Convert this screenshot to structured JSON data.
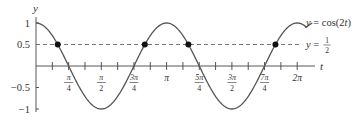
{
  "chart_data": {
    "type": "line",
    "title": "",
    "xlabel": "t",
    "ylabel": "y",
    "xlim": [
      0,
      6.5
    ],
    "ylim": [
      -1,
      1
    ],
    "grid": false,
    "x_ticks": [
      {
        "value": 0.3927,
        "label": ""
      },
      {
        "value": 0.7854,
        "label": "π/4",
        "num": "π",
        "den": "4"
      },
      {
        "value": 1.1781,
        "label": ""
      },
      {
        "value": 1.5708,
        "label": "π/2",
        "num": "π",
        "den": "2"
      },
      {
        "value": 1.9635,
        "label": ""
      },
      {
        "value": 2.3562,
        "label": "3π/4",
        "num": "3π",
        "den": "4"
      },
      {
        "value": 2.7489,
        "label": ""
      },
      {
        "value": 3.1416,
        "label": "π",
        "num": "π",
        "den": ""
      },
      {
        "value": 3.5343,
        "label": ""
      },
      {
        "value": 3.927,
        "label": "5π/4",
        "num": "5π",
        "den": "4"
      },
      {
        "value": 4.3197,
        "label": ""
      },
      {
        "value": 4.7124,
        "label": "3π/2",
        "num": "3π",
        "den": "2"
      },
      {
        "value": 5.1051,
        "label": ""
      },
      {
        "value": 5.4978,
        "label": "7π/4",
        "num": "7π",
        "den": "4"
      },
      {
        "value": 5.8905,
        "label": ""
      },
      {
        "value": 6.2832,
        "label": "2π",
        "num": "2π",
        "den": ""
      }
    ],
    "y_ticks": [
      {
        "value": 1,
        "label": "1"
      },
      {
        "value": 0.5,
        "label": "0.5"
      },
      {
        "value": -0.5,
        "label": "−0.5"
      },
      {
        "value": -1,
        "label": "−1"
      }
    ],
    "series": [
      {
        "name": "y = cos(2t)",
        "style": "solid",
        "function": "cos(2t)",
        "x_range": [
          0,
          6.5
        ],
        "legend_label": "y = cos(2t)"
      },
      {
        "name": "y = 1/2",
        "style": "dashed",
        "function": "0.5",
        "x_range": [
          0,
          6.5
        ],
        "legend_label": "y = 1/2"
      }
    ],
    "intersection_points": [
      {
        "t": 0.5236,
        "t_label": "π/6",
        "y": 0.5
      },
      {
        "t": 2.618,
        "t_label": "5π/6",
        "y": 0.5
      },
      {
        "t": 3.6652,
        "t_label": "7π/6",
        "y": 0.5
      },
      {
        "t": 5.7596,
        "t_label": "11π/6",
        "y": 0.5
      }
    ],
    "annotations": [
      {
        "text": "y = cos(2t)",
        "near": "curve end, top right"
      },
      {
        "text": "y = 1/2",
        "near": "dashed line end, right"
      }
    ]
  },
  "labels": {
    "y_axis": "y",
    "x_axis": "t",
    "curve_legend": "y = cos(2t)",
    "line_legend_prefix": "y =",
    "line_legend_num": "1",
    "line_legend_den": "2"
  },
  "colors": {
    "curve": "#555555",
    "axis": "#444444",
    "dashed": "#666666",
    "points": "#111111",
    "text": "#333333"
  }
}
